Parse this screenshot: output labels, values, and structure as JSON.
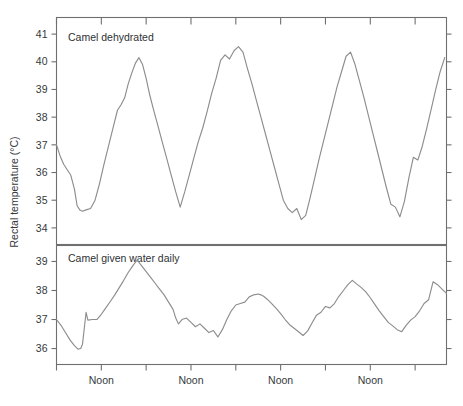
{
  "figure": {
    "background": "#ffffff",
    "line_color": "#8d8d8d",
    "axis_color": "#6f6f6f",
    "text_color": "#35393c",
    "ylabel": "Rectal temperature (°C)"
  },
  "chart_data": {
    "type": "line",
    "title": "",
    "subtitle": "",
    "xlabel": "",
    "ylabel": "Rectal temperature (°C)",
    "grid": false,
    "legend": "none",
    "annotations": [
      "Camel dehydrated",
      "Camel given water daily"
    ],
    "x_tick_labels": [
      "Noon",
      "Noon",
      "Noon",
      "Noon"
    ],
    "x_tick_positions_days": [
      0.5,
      1.5,
      2.5,
      3.5
    ],
    "x_minor_tick_positions_days": [
      0,
      1,
      2,
      3,
      4
    ],
    "xlim_days": [
      0,
      4.35
    ],
    "panels": [
      {
        "name": "camel-dehydrated",
        "label": "Camel dehydrated",
        "ylim": [
          33.4,
          41.6
        ],
        "y_ticks": [
          34,
          35,
          36,
          37,
          38,
          39,
          40,
          41
        ],
        "y_tick_labels": [
          "34",
          "35",
          "36",
          "37",
          "38",
          "39",
          "40",
          "41"
        ],
        "series": [
          {
            "name": "Rectal temperature, dehydrated camel",
            "x": [
              0.0,
              0.04,
              0.08,
              0.12,
              0.16,
              0.2,
              0.23,
              0.26,
              0.29,
              0.33,
              0.38,
              0.43,
              0.48,
              0.53,
              0.58,
              0.63,
              0.68,
              0.72,
              0.76,
              0.8,
              0.84,
              0.88,
              0.92,
              0.96,
              1.0,
              1.04,
              1.08,
              1.13,
              1.18,
              1.23,
              1.28,
              1.33,
              1.38,
              1.43,
              1.48,
              1.53,
              1.58,
              1.63,
              1.68,
              1.73,
              1.78,
              1.83,
              1.88,
              1.93,
              1.98,
              2.03,
              2.08,
              2.13,
              2.18,
              2.23,
              2.28,
              2.33,
              2.38,
              2.43,
              2.48,
              2.53,
              2.58,
              2.63,
              2.68,
              2.73,
              2.78,
              2.83,
              2.88,
              2.93,
              2.98,
              3.03,
              3.08,
              3.13,
              3.18,
              3.23,
              3.28,
              3.33,
              3.38,
              3.43,
              3.48,
              3.53,
              3.58,
              3.63,
              3.68,
              3.73,
              3.78,
              3.83,
              3.88,
              3.93,
              3.98,
              4.03,
              4.08,
              4.13,
              4.18,
              4.23,
              4.28,
              4.33
            ],
            "y": [
              37.0,
              36.6,
              36.3,
              36.1,
              35.9,
              35.4,
              34.8,
              34.65,
              34.6,
              34.65,
              34.7,
              35.0,
              35.6,
              36.3,
              36.95,
              37.6,
              38.25,
              38.45,
              38.7,
              39.2,
              39.6,
              39.95,
              40.15,
              39.9,
              39.4,
              38.8,
              38.3,
              37.7,
              37.1,
              36.5,
              35.9,
              35.3,
              34.75,
              35.3,
              35.9,
              36.5,
              37.1,
              37.6,
              38.2,
              38.85,
              39.4,
              40.05,
              40.25,
              40.1,
              40.4,
              40.55,
              40.35,
              39.75,
              39.2,
              38.6,
              38.0,
              37.4,
              36.8,
              36.2,
              35.6,
              35.0,
              34.7,
              34.55,
              34.7,
              34.3,
              34.45,
              35.1,
              35.8,
              36.5,
              37.15,
              37.8,
              38.45,
              39.1,
              39.65,
              40.2,
              40.35,
              39.9,
              39.3,
              38.7,
              38.05,
              37.4,
              36.75,
              36.1,
              35.45,
              34.85,
              34.75,
              34.4,
              34.95,
              35.8,
              36.55,
              36.45,
              36.95,
              37.6,
              38.3,
              39.0,
              39.65,
              40.15
            ]
          }
        ]
      },
      {
        "name": "camel-given-water-daily",
        "label": "Camel given water daily",
        "ylim": [
          35.45,
          39.55
        ],
        "y_ticks": [
          36,
          37,
          38,
          39
        ],
        "y_tick_labels": [
          "36",
          "37",
          "38",
          "39"
        ],
        "series": [
          {
            "name": "Rectal temperature, watered camel",
            "x": [
              0.0,
              0.05,
              0.1,
              0.15,
              0.2,
              0.24,
              0.27,
              0.29,
              0.31,
              0.33,
              0.35,
              0.4,
              0.45,
              0.5,
              0.55,
              0.6,
              0.65,
              0.7,
              0.75,
              0.8,
              0.85,
              0.9,
              0.95,
              1.0,
              1.05,
              1.1,
              1.15,
              1.2,
              1.25,
              1.3,
              1.33,
              1.36,
              1.4,
              1.45,
              1.5,
              1.55,
              1.6,
              1.65,
              1.7,
              1.75,
              1.8,
              1.85,
              1.9,
              1.95,
              2.0,
              2.05,
              2.1,
              2.15,
              2.2,
              2.25,
              2.28,
              2.31,
              2.35,
              2.4,
              2.45,
              2.5,
              2.55,
              2.6,
              2.65,
              2.7,
              2.75,
              2.8,
              2.85,
              2.9,
              2.95,
              3.0,
              3.05,
              3.1,
              3.15,
              3.2,
              3.25,
              3.3,
              3.35,
              3.4,
              3.45,
              3.5,
              3.55,
              3.6,
              3.65,
              3.7,
              3.75,
              3.8,
              3.85,
              3.9,
              3.95,
              4.0,
              4.05,
              4.1,
              4.15,
              4.2,
              4.25,
              4.3,
              4.35
            ],
            "y": [
              37.0,
              36.8,
              36.55,
              36.3,
              36.1,
              35.98,
              36.0,
              36.15,
              36.7,
              37.25,
              36.98,
              37.0,
              37.0,
              37.18,
              37.4,
              37.62,
              37.85,
              38.1,
              38.35,
              38.62,
              38.85,
              39.05,
              38.85,
              38.65,
              38.45,
              38.25,
              38.05,
              37.85,
              37.6,
              37.35,
              37.05,
              36.85,
              37.0,
              37.05,
              36.9,
              36.75,
              36.85,
              36.7,
              36.55,
              36.62,
              36.4,
              36.65,
              37.0,
              37.3,
              37.5,
              37.55,
              37.6,
              37.78,
              37.85,
              37.88,
              37.85,
              37.8,
              37.7,
              37.55,
              37.38,
              37.2,
              37.0,
              36.82,
              36.7,
              36.58,
              36.45,
              36.6,
              36.88,
              37.15,
              37.25,
              37.45,
              37.4,
              37.55,
              37.8,
              38.0,
              38.2,
              38.35,
              38.22,
              38.1,
              37.95,
              37.75,
              37.52,
              37.3,
              37.1,
              36.9,
              36.78,
              36.65,
              36.58,
              36.8,
              36.98,
              37.1,
              37.3,
              37.55,
              37.68,
              38.3,
              38.2,
              38.05,
              37.9
            ]
          }
        ]
      }
    ]
  }
}
